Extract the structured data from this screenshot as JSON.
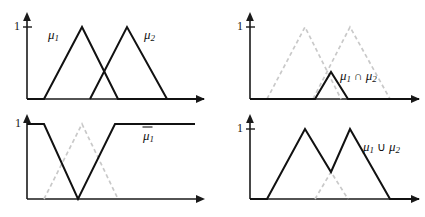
{
  "figure": {
    "background_color": "#ffffff",
    "solid_color": "#111111",
    "dashed_color": "#c9c9c9",
    "axis_color": "#1a1a1a"
  },
  "panels": [
    {
      "id": "top-left",
      "name": "membership-functions-panel",
      "y_tick_label": "1",
      "labels": [
        {
          "name": "mu1-label",
          "base": "μ",
          "sub": "1",
          "op": "",
          "base2": "",
          "sub2": "",
          "x": 48,
          "y": 36
        },
        {
          "name": "mu2-label",
          "base": "μ",
          "sub": "2",
          "op": "",
          "base2": "",
          "sub2": "",
          "x": 144,
          "y": 36
        }
      ],
      "axes": {
        "origin_x": 27,
        "baseline_y": 99,
        "top_y": 14,
        "right_x": 204,
        "one_y": 27
      },
      "solid_curves": [
        {
          "name": "mu1-triangle",
          "points": "27,99 44,99 82,27 118,99 204,99"
        },
        {
          "name": "mu2-triangle",
          "points": "90,99 127,27 167,99"
        }
      ],
      "dashed_curves": []
    },
    {
      "id": "top-right",
      "name": "intersection-panel",
      "y_tick_label": "1",
      "labels": [
        {
          "name": "mu1-cap-mu2-label",
          "base": "μ",
          "sub": "1",
          "op": " ∩ ",
          "base2": "μ",
          "sub2": "2",
          "x": 340,
          "y": 77
        }
      ],
      "axes": {
        "origin_x": 250,
        "baseline_y": 99,
        "top_y": 14,
        "right_x": 419,
        "one_y": 27
      },
      "solid_curves": [
        {
          "name": "intersection-curve",
          "points": "250,99 315,99 331,72 348,99 419,99"
        }
      ],
      "dashed_curves": [
        {
          "name": "mu1-triangle-ghost",
          "points": "267,99 305,27 341,99"
        },
        {
          "name": "mu2-triangle-ghost",
          "points": "313,99 350,27 390,99"
        }
      ]
    },
    {
      "id": "bottom-left",
      "name": "complement-panel",
      "y_tick_label": "1",
      "labels": [
        {
          "name": "mu1-complement-label",
          "base": "μ",
          "sub": "1",
          "op": "",
          "base2": "",
          "sub2": "",
          "overbar": true,
          "x": 143,
          "y": 137
        }
      ],
      "axes": {
        "origin_x": 27,
        "baseline_y": 199,
        "top_y": 116,
        "right_x": 204,
        "one_y": 124
      },
      "solid_curves": [
        {
          "name": "complement-curve",
          "points": "27,124 44,124 78,199 115,124 195,124"
        }
      ],
      "dashed_curves": [
        {
          "name": "mu1-triangle-ghost",
          "points": "44,199 82,124 118,199"
        }
      ]
    },
    {
      "id": "bottom-right",
      "name": "union-panel",
      "y_tick_label": "1",
      "labels": [
        {
          "name": "mu1-cup-mu2-label",
          "base": "μ",
          "sub": "1",
          "op": " ∪ ",
          "base2": "μ",
          "sub2": "2",
          "x": 363,
          "y": 148
        }
      ],
      "axes": {
        "origin_x": 250,
        "baseline_y": 199,
        "top_y": 116,
        "right_x": 419,
        "one_y": 129
      },
      "solid_curves": [
        {
          "name": "union-curve",
          "points": "250,199 267,199 305,129 331,172 350,129 390,199 419,199"
        }
      ],
      "dashed_curves": [
        {
          "name": "intersection-triangle-ghost",
          "points": "315,199 331,172 348,199"
        }
      ]
    }
  ]
}
